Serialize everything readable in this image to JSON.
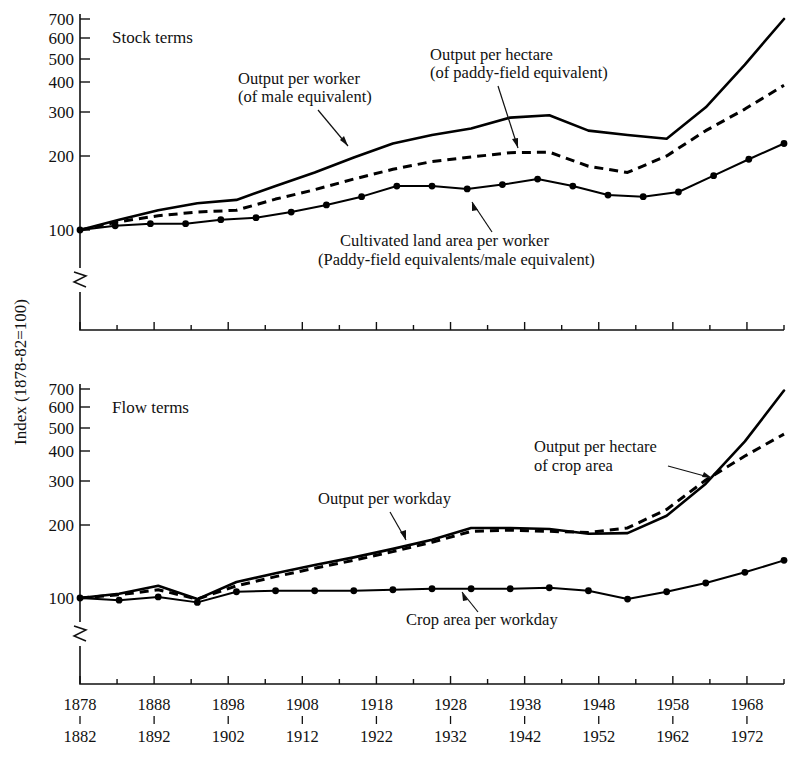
{
  "figure": {
    "y_axis_title": "Index (1878-82=100)",
    "x_tick_labels_top": [
      "1878",
      "1888",
      "1898",
      "1908",
      "1918",
      "1928",
      "1938",
      "1948",
      "1958",
      "1968"
    ],
    "x_tick_labels_bottom": [
      "1882",
      "1892",
      "1902",
      "1912",
      "1922",
      "1932",
      "1942",
      "1952",
      "1962",
      "1972"
    ],
    "y_tick_labels": [
      "700",
      "600",
      "500",
      "400",
      "300",
      "200",
      "100"
    ],
    "axis_break_symbol": "axis-break-zigzag"
  },
  "chart_data": [
    {
      "type": "line",
      "title": "Stock terms",
      "xlabel": "",
      "ylabel": "Index (1878-82=100)",
      "yscale": "log",
      "ylim": [
        100,
        700
      ],
      "yticks": [
        100,
        200,
        300,
        400,
        500,
        600,
        700
      ],
      "grid": false,
      "legend": "inline-annotations",
      "x": [
        "1878-82",
        "1883-87",
        "1888-92",
        "1893-97",
        "1898-1902",
        "1903-07",
        "1908-12",
        "1913-17",
        "1918-22",
        "1923-27",
        "1928-32",
        "1933-37",
        "1938-42",
        "1943-47",
        "1948-52",
        "1953-57",
        "1958-62",
        "1963-67",
        "1968-72"
      ],
      "x_numeric": [
        1880,
        1885,
        1890,
        1895,
        1900,
        1905,
        1910,
        1915,
        1920,
        1925,
        1930,
        1935,
        1940,
        1945,
        1950,
        1955,
        1960,
        1965,
        1970
      ],
      "series": [
        {
          "name": "Output per worker (of male equivalent)",
          "style": "solid",
          "markers": false,
          "values": [
            100,
            110,
            120,
            128,
            132,
            150,
            170,
            195,
            222,
            240,
            255,
            282,
            288,
            250,
            240,
            232,
            310,
            460,
            700
          ]
        },
        {
          "name": "Output per hectare (of paddy-field equivalent)",
          "style": "dashed",
          "markers": false,
          "values": [
            100,
            108,
            114,
            118,
            120,
            133,
            145,
            160,
            175,
            188,
            196,
            204,
            205,
            180,
            170,
            198,
            250,
            305,
            380
          ]
        },
        {
          "name": "Cultivated land area per worker (Paddy-field equivalents/male equivalent)",
          "style": "solid-markers",
          "markers": true,
          "values": [
            100,
            104,
            106,
            106,
            110,
            112,
            118,
            126,
            136,
            150,
            150,
            146,
            152,
            160,
            150,
            138,
            136,
            142,
            165,
            192,
            222
          ]
        }
      ],
      "annotations": [
        {
          "text_line1": "Output per worker",
          "text_line2": "(of male equivalent)",
          "target": "Output per worker"
        },
        {
          "text_line1": "Output per hectare",
          "text_line2": "(of paddy-field equivalent)",
          "target": "Output per hectare"
        },
        {
          "text_line1": "Cultivated land area per worker",
          "text_line2": "(Paddy-field equivalents/male equivalent)",
          "target": "Cultivated land area per worker"
        }
      ]
    },
    {
      "type": "line",
      "title": "Flow terms",
      "xlabel": "",
      "ylabel": "Index (1878-82=100)",
      "yscale": "log",
      "ylim": [
        100,
        700
      ],
      "yticks": [
        100,
        200,
        300,
        400,
        500,
        600,
        700
      ],
      "grid": false,
      "legend": "inline-annotations",
      "x": [
        "1878-82",
        "1883-87",
        "1888-92",
        "1893-97",
        "1898-1902",
        "1903-07",
        "1908-12",
        "1913-17",
        "1918-22",
        "1923-27",
        "1928-32",
        "1933-37",
        "1938-42",
        "1943-47",
        "1948-52",
        "1953-57",
        "1958-62",
        "1963-67",
        "1968-72"
      ],
      "x_numeric": [
        1880,
        1885,
        1890,
        1895,
        1900,
        1905,
        1910,
        1915,
        1920,
        1925,
        1930,
        1935,
        1940,
        1945,
        1950,
        1955,
        1960,
        1965,
        1970
      ],
      "series": [
        {
          "name": "Output per workday",
          "style": "solid",
          "markers": false,
          "values": [
            100,
            104,
            112,
            99,
            116,
            126,
            136,
            146,
            158,
            172,
            192,
            192,
            190,
            182,
            183,
            215,
            290,
            430,
            690
          ]
        },
        {
          "name": "Output per hectare of crop area",
          "style": "dashed",
          "markers": false,
          "values": [
            100,
            103,
            108,
            99,
            112,
            122,
            132,
            142,
            154,
            168,
            186,
            188,
            186,
            184,
            192,
            228,
            300,
            375,
            460
          ]
        },
        {
          "name": "Crop area per workday",
          "style": "solid-markers",
          "markers": true,
          "values": [
            100,
            98,
            101,
            96,
            106,
            107,
            107,
            107,
            108,
            109,
            109,
            109,
            110,
            107,
            99,
            106,
            115,
            127,
            142
          ]
        }
      ],
      "annotations": [
        {
          "text_line1": "Output per workday",
          "text_line2": "",
          "target": "Output per workday"
        },
        {
          "text_line1": "Output per hectare",
          "text_line2": "of crop area",
          "target": "Output per hectare of crop area"
        },
        {
          "text_line1": "Crop area per workday",
          "text_line2": "",
          "target": "Crop area per workday"
        }
      ]
    }
  ]
}
